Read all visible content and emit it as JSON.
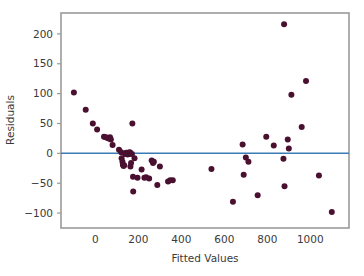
{
  "chart_data": {
    "type": "scatter",
    "title": "",
    "xlabel": "Fitted Values",
    "ylabel": "Residuals",
    "xlim": [
      -160,
      1180
    ],
    "ylim": [
      -125,
      235
    ],
    "xticks": [
      0,
      200,
      400,
      600,
      800,
      1000
    ],
    "xtick_labels": [
      "0",
      "200",
      "400",
      "600",
      "800",
      "1000"
    ],
    "yticks": [
      -100,
      -50,
      0,
      50,
      100,
      150,
      200
    ],
    "ytick_labels": [
      "−100",
      "−50",
      "0",
      "50",
      "100",
      "150",
      "200"
    ],
    "grid": false,
    "legend": null,
    "reference_line": {
      "orientation": "horizontal",
      "y": 0,
      "color": "#3b7cb5"
    },
    "marker": {
      "shape": "circle",
      "color": "#4a1030",
      "size": 3.0
    },
    "points": [
      [
        -100,
        102
      ],
      [
        -45,
        73
      ],
      [
        -12,
        50
      ],
      [
        8,
        40
      ],
      [
        40,
        28
      ],
      [
        48,
        27
      ],
      [
        55,
        26
      ],
      [
        62,
        25
      ],
      [
        68,
        27
      ],
      [
        72,
        23
      ],
      [
        80,
        14
      ],
      [
        110,
        6
      ],
      [
        120,
        2
      ],
      [
        122,
        -8
      ],
      [
        126,
        -14
      ],
      [
        128,
        -19
      ],
      [
        131,
        -21
      ],
      [
        134,
        -20
      ],
      [
        138,
        -1
      ],
      [
        141,
        0
      ],
      [
        144,
        1
      ],
      [
        147,
        0
      ],
      [
        150,
        -2
      ],
      [
        152,
        1
      ],
      [
        155,
        0
      ],
      [
        158,
        -1
      ],
      [
        160,
        2
      ],
      [
        162,
        1
      ],
      [
        163,
        -22
      ],
      [
        166,
        -16
      ],
      [
        170,
        -1
      ],
      [
        172,
        50
      ],
      [
        175,
        -39
      ],
      [
        176,
        -64
      ],
      [
        182,
        -8
      ],
      [
        196,
        -41
      ],
      [
        215,
        -27
      ],
      [
        228,
        -41
      ],
      [
        236,
        -40
      ],
      [
        250,
        -42
      ],
      [
        262,
        -12
      ],
      [
        268,
        -16
      ],
      [
        272,
        -14
      ],
      [
        288,
        -53
      ],
      [
        300,
        -22
      ],
      [
        338,
        -47
      ],
      [
        348,
        -45
      ],
      [
        360,
        -45
      ],
      [
        540,
        -26
      ],
      [
        640,
        -81
      ],
      [
        685,
        15
      ],
      [
        690,
        -36
      ],
      [
        700,
        -7
      ],
      [
        712,
        -14
      ],
      [
        755,
        -70
      ],
      [
        795,
        28
      ],
      [
        830,
        13
      ],
      [
        875,
        -9
      ],
      [
        878,
        216
      ],
      [
        880,
        -55
      ],
      [
        895,
        23
      ],
      [
        900,
        8
      ],
      [
        912,
        98
      ],
      [
        960,
        44
      ],
      [
        980,
        121
      ],
      [
        1040,
        -37
      ],
      [
        1100,
        -98
      ]
    ]
  },
  "axes": {
    "x_title": "Fitted Values",
    "y_title": "Residuals"
  },
  "colors": {
    "point": "#4a1030",
    "reference_line": "#3b7cb5",
    "frame": "#9a9a9a",
    "text": "#3a3a3a",
    "background": "#ffffff"
  }
}
